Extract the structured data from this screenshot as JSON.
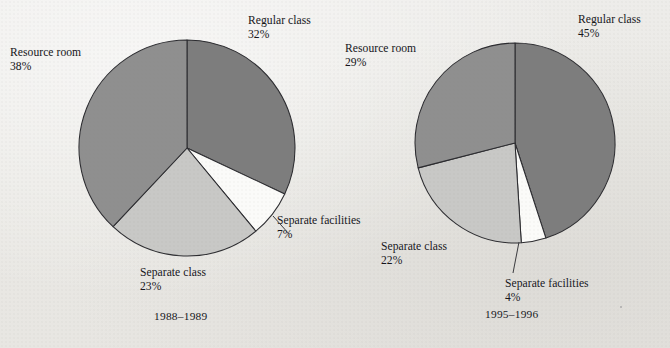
{
  "figure": {
    "background_color": "#ecebe8",
    "ink_color": "#15151a"
  },
  "palette": {
    "regular_class": "#7d7d7d",
    "resource_room": "#8f8f8f",
    "separate_class": "#c8c8c6",
    "separate_facilities": "#fbfbf9",
    "slice_outline": "#2c2c30"
  },
  "chart_data": [
    {
      "type": "pie",
      "title": "1988–1989",
      "categories": [
        "Regular class",
        "Separate facilities",
        "Separate class",
        "Resource room"
      ],
      "values": [
        32,
        7,
        23,
        38
      ],
      "unit": "%",
      "start_angle_deg": 0,
      "direction": "clockwise",
      "colors": [
        "#7d7d7d",
        "#fbfbf9",
        "#c8c8c6",
        "#8f8f8f"
      ],
      "labels": [
        {
          "name": "Regular class",
          "value": "32%"
        },
        {
          "name": "Separate facilities",
          "value": "7%"
        },
        {
          "name": "Separate class",
          "value": "23%"
        },
        {
          "name": "Resource room",
          "value": "38%"
        }
      ]
    },
    {
      "type": "pie",
      "title": "1995–1996",
      "categories": [
        "Regular class",
        "Separate facilities",
        "Separate class",
        "Resource room"
      ],
      "values": [
        45,
        4,
        22,
        29
      ],
      "unit": "%",
      "start_angle_deg": 0,
      "direction": "clockwise",
      "colors": [
        "#7d7d7d",
        "#fbfbf9",
        "#c8c8c6",
        "#8f8f8f"
      ],
      "labels": [
        {
          "name": "Regular class",
          "value": "45%"
        },
        {
          "name": "Separate facilities",
          "value": "4%"
        },
        {
          "name": "Separate class",
          "value": "22%"
        },
        {
          "name": "Resource room",
          "value": "29%"
        }
      ]
    }
  ],
  "left_chart": {
    "caption": "1988–1989",
    "regular_class_label": "Regular class",
    "regular_class_pct": "32%",
    "resource_room_label": "Resource room",
    "resource_room_pct": "38%",
    "separate_class_label": "Separate class",
    "separate_class_pct": "23%",
    "separate_facilities_label": "Separate facilities",
    "separate_facilities_pct": "7%"
  },
  "right_chart": {
    "caption": "1995–1996",
    "regular_class_label": "Regular class",
    "regular_class_pct": "45%",
    "resource_room_label": "Resource room",
    "resource_room_pct": "29%",
    "separate_class_label": "Separate class",
    "separate_class_pct": "22%",
    "separate_facilities_label": "Separate facilities",
    "separate_facilities_pct": "4%"
  }
}
